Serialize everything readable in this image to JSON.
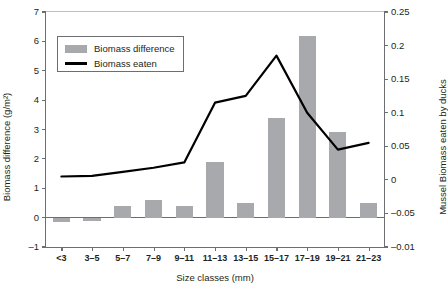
{
  "chart_data": {
    "type": "bar",
    "title": "",
    "categories": [
      "<3",
      "3–5",
      "5–7",
      "7–9",
      "9–11",
      "11–13",
      "13–15",
      "15–17",
      "17–19",
      "19–21",
      "21–23"
    ],
    "xlabel": "Size classes (mm)",
    "ylabel": "Biomass difference (g/m²)",
    "y2label": "Mussel Biomass eaten by ducks",
    "ylim": [
      -1,
      7
    ],
    "y2lim": [
      -0.1,
      0.25
    ],
    "yticks": [
      7,
      6,
      5,
      4,
      3,
      2,
      1,
      0,
      -1
    ],
    "ytick_labels": [
      "7",
      "6",
      "5",
      "4",
      "3",
      "2",
      "1",
      "0",
      "–1"
    ],
    "y2ticks": [
      0.25,
      0.2,
      0.15,
      0.1,
      0.05,
      0,
      -0.05,
      -0.1
    ],
    "y2tick_labels": [
      "0.25",
      "0.2",
      "0.15",
      "0.1",
      "0.05",
      "0",
      "–0.05",
      "–0.01"
    ],
    "grid": false,
    "legend_position": "upper-left",
    "series": [
      {
        "name": "Biomass difference",
        "type": "bar",
        "axis": "left",
        "color": "#a7a9ac",
        "values": [
          -0.15,
          -0.12,
          0.4,
          0.6,
          0.4,
          1.9,
          0.5,
          3.4,
          6.2,
          2.9,
          0.5
        ]
      },
      {
        "name": "Biomass eaten",
        "type": "line",
        "axis": "right",
        "color": "#000000",
        "values": [
          0.005,
          0.006,
          0.012,
          0.018,
          0.026,
          0.115,
          0.125,
          0.185,
          0.1,
          0.045,
          0.055
        ]
      }
    ]
  },
  "legend": {
    "items": [
      {
        "label": "Biomass difference",
        "marker": "bar-swatch"
      },
      {
        "label": "Biomass eaten",
        "marker": "line-swatch"
      }
    ]
  },
  "colors": {
    "bar": "#a7a9ac",
    "line": "#000000",
    "axis": "#6d6e71",
    "text": "#231f20",
    "background": "#ffffff"
  }
}
